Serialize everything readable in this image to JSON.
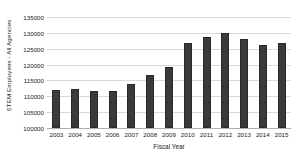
{
  "chart_data": {
    "type": "bar",
    "title": "",
    "xlabel": "Fiscal Year",
    "ylabel": "STEM Employees - All Agencies",
    "categories": [
      "2003",
      "2004",
      "2005",
      "2006",
      "2007",
      "2008",
      "2009",
      "2010",
      "2011",
      "2012",
      "2013",
      "2014",
      "2015"
    ],
    "values": [
      112000,
      112300,
      111700,
      111700,
      113900,
      116700,
      119200,
      126800,
      128700,
      130000,
      128100,
      126200,
      126800
    ],
    "ylim": [
      100000,
      135000
    ],
    "ytick_labels": [
      "135000",
      "130000",
      "125000",
      "120000",
      "115000",
      "110000",
      "105000",
      "100000"
    ],
    "ytick_values": [
      135000,
      130000,
      125000,
      120000,
      115000,
      110000,
      105000,
      100000
    ],
    "grid": true,
    "legend": false,
    "bar_color": "#3a3a3a",
    "grid_color": "#d9d9d9",
    "background_color": "#ffffff"
  }
}
